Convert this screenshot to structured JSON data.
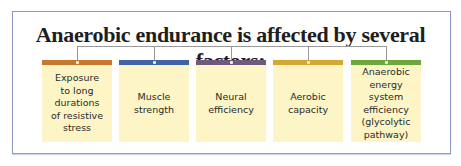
{
  "title": "Anaerobic endurance is affected by several factors:",
  "factors": [
    {
      "label": "Exposure\nto long\ndurations\nof resistive\nstress",
      "color": "#c8782a"
    },
    {
      "label": "Muscle\nstrength",
      "color": "#3f64a8"
    },
    {
      "label": "Neural\nefficiency",
      "color": "#6e5a7e"
    },
    {
      "label": "Aerobic\ncapacity",
      "color": "#d4a832"
    },
    {
      "label": "Anaerobic\nenergy system\nefficiency\n(glycolytic\npathway)",
      "color": "#6fa83a"
    }
  ],
  "colors": {
    "card_background": "#fdf5c6",
    "frame_border": "#8a9cc4",
    "connector": "#9a9a9a"
  }
}
